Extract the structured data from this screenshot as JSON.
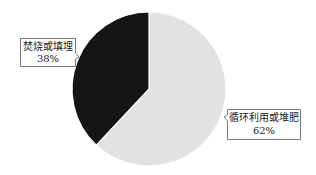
{
  "chart_data": {
    "type": "pie",
    "title": "",
    "categories": [
      "循环利用或堆肥",
      "焚烧或填埋"
    ],
    "values": [
      62,
      38
    ],
    "unit": "%",
    "colors": [
      "#e2e2e2",
      "#151515"
    ],
    "labels": [
      {
        "name": "循环利用或堆肥",
        "value_text": "62%"
      },
      {
        "name": "焚烧或填埋",
        "value_text": "38%"
      }
    ],
    "start_angle_deg": 0,
    "direction": "clockwise",
    "legend": "none (callout labels)"
  }
}
